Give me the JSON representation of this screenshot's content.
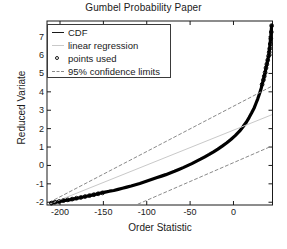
{
  "chart_data": {
    "type": "scatter",
    "title": "Gumbel Probability Paper",
    "xlabel": "Order Statistic",
    "ylabel": "Reduced Variate",
    "xlim": [
      -215,
      45
    ],
    "ylim": [
      -2.15,
      7.85
    ],
    "xticks": [
      -200,
      -150,
      -100,
      -50,
      0
    ],
    "xtick_labels": [
      "-200",
      "-150",
      "-100",
      "-50",
      "0"
    ],
    "yticks": [
      -2,
      -1,
      0,
      1,
      2,
      3,
      4,
      5,
      6,
      7
    ],
    "ytick_labels": [
      "-2",
      "-1",
      "0",
      "1",
      "2",
      "3",
      "4",
      "5",
      "6",
      "7"
    ],
    "grid": false,
    "legend_position": "upper left",
    "series": [
      {
        "name": "CDF",
        "style": "solid-thick-line",
        "color": "#000000",
        "x": [
          -210,
          -205,
          -200,
          -194,
          -188,
          -184,
          -180,
          -176,
          -172,
          -168,
          -163,
          -158,
          -153,
          -148,
          -143,
          -138,
          -133,
          -128,
          -123,
          -118,
          -113,
          -108,
          -103,
          -98,
          -93,
          -88,
          -83,
          -78,
          -73,
          -68,
          -63,
          -58,
          -53,
          -48,
          -43,
          -38,
          -33,
          -28,
          -23,
          -18,
          -13,
          -8,
          -3,
          2,
          7,
          11,
          15,
          18,
          21,
          24,
          26,
          28,
          30,
          32,
          33,
          34.5,
          35.5,
          36.5,
          37.5,
          38.5,
          39.5,
          40.5,
          41,
          41.5,
          42,
          42.5,
          43,
          43.5,
          44
        ],
        "y": [
          -2.05,
          -2.0,
          -1.95,
          -1.9,
          -1.86,
          -1.82,
          -1.78,
          -1.74,
          -1.7,
          -1.66,
          -1.61,
          -1.56,
          -1.5,
          -1.45,
          -1.4,
          -1.36,
          -1.3,
          -1.24,
          -1.18,
          -1.12,
          -1.05,
          -0.98,
          -0.9,
          -0.82,
          -0.74,
          -0.66,
          -0.58,
          -0.5,
          -0.41,
          -0.32,
          -0.22,
          -0.12,
          -0.01,
          0.1,
          0.22,
          0.34,
          0.47,
          0.6,
          0.74,
          0.89,
          1.05,
          1.22,
          1.41,
          1.62,
          1.86,
          2.1,
          2.36,
          2.6,
          2.86,
          3.14,
          3.38,
          3.62,
          3.9,
          4.2,
          4.4,
          4.65,
          4.85,
          5.05,
          5.3,
          5.5,
          5.72,
          5.95,
          6.1,
          6.3,
          6.5,
          6.75,
          7.0,
          7.3,
          7.6
        ]
      },
      {
        "name": "linear regression",
        "style": "solid-faint-line",
        "color": "#c9c9c9",
        "x": [
          -212,
          44
        ],
        "y": [
          -2.1,
          2.75
        ]
      },
      {
        "name": "95% confidence upper",
        "style": "dashed-line",
        "color": "#8a8a8a",
        "x": [
          -212,
          44
        ],
        "y": [
          -2.0,
          4.3
        ]
      },
      {
        "name": "95% confidence lower",
        "style": "dashed-line",
        "color": "#8a8a8a",
        "x": [
          -110,
          44
        ],
        "y": [
          -2.1,
          1.05
        ]
      }
    ],
    "points_used_markers": {
      "name": "points used",
      "style": "open-circle",
      "color": "#000000",
      "x": [
        -210,
        -206,
        -201,
        -196,
        -191,
        -186,
        -181,
        -176,
        -171,
        -166,
        -161,
        -156,
        -151,
        33,
        34.5,
        35.5,
        36.5,
        37.5,
        38.5,
        39.5,
        40.5,
        41.2,
        41.8,
        42.4,
        43,
        43.6,
        44
      ],
      "y": [
        -2.05,
        -2.0,
        -1.96,
        -1.91,
        -1.87,
        -1.83,
        -1.78,
        -1.74,
        -1.69,
        -1.64,
        -1.59,
        -1.54,
        -1.49,
        4.4,
        4.65,
        4.85,
        5.05,
        5.3,
        5.5,
        5.72,
        5.95,
        6.15,
        6.35,
        6.6,
        6.9,
        7.25,
        7.6
      ]
    },
    "legend": [
      {
        "label": "CDF",
        "marker": "solid-line"
      },
      {
        "label": "linear regression",
        "marker": "faint-line"
      },
      {
        "label": "points used",
        "marker": "open-circle"
      },
      {
        "label": "95% confidence limits",
        "marker": "dashed-line"
      }
    ],
    "colors": {
      "data": "#000000",
      "regression": "#c9c9c9",
      "confidence": "#8a8a8a",
      "axis": "#1a1a1a",
      "background": "#ffffff"
    }
  }
}
